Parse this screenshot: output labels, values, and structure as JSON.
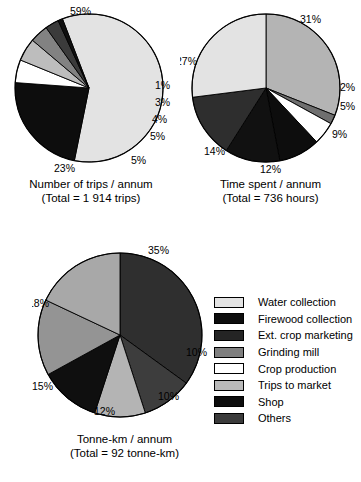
{
  "chart_data": [
    {
      "type": "pie",
      "id": "trips",
      "title": "Number of trips / annum",
      "subtitle": "(Total = 1  914 trips)",
      "total_label": "1  914 trips",
      "categories": [
        "Water collection",
        "Firewood collection",
        "Ext.  crop  marketing",
        "Grinding mill",
        "Crop production",
        "Trips to market",
        "Shop",
        "Others"
      ],
      "values": [
        59,
        23,
        1,
        3,
        4,
        5,
        5,
        0
      ],
      "labels": [
        "59%",
        "23%",
        "1%",
        "3%",
        "4%",
        "5%",
        "5%"
      ],
      "slices": [
        {
          "name": "Water collection",
          "value": 59,
          "label": "59%",
          "color": "#e3e3e3",
          "start": -111,
          "end": 101.4,
          "label_x": 70,
          "label_y": 2,
          "label_anchor": "center"
        },
        {
          "name": "Firewood collection",
          "value": 23,
          "label": "23%",
          "color": "#0d0d0d",
          "start": 101.4,
          "end": 184.2,
          "label_x": 54,
          "label_y": 159,
          "label_anchor": "center"
        },
        {
          "name": "Crop production",
          "value": 5,
          "label": "5%",
          "color": "#ffffff",
          "start": 184.2,
          "end": 202.2,
          "label_x": 131,
          "label_y": 151,
          "label_anchor": "center"
        },
        {
          "name": "Trips to market",
          "value": 5,
          "label": "5%",
          "color": "#bdbdbd",
          "start": 202.2,
          "end": 220.2,
          "label_x": 150,
          "label_y": 127,
          "label_anchor": "center"
        },
        {
          "name": "Grinding mill",
          "value": 4,
          "label": "4%",
          "color": "#828282",
          "start": 220.2,
          "end": 234.6,
          "label_x": 152,
          "label_y": 110,
          "label_anchor": "center"
        },
        {
          "name": "Others",
          "value": 3,
          "label": "3%",
          "color": "#3b3b3b",
          "start": 234.6,
          "end": 245.4,
          "label_x": 155,
          "label_y": 93,
          "label_anchor": "center"
        },
        {
          "name": "Shop",
          "value": 1,
          "label": "1%",
          "color": "#101010",
          "start": 245.4,
          "end": 249,
          "label_x": 155,
          "label_y": 76,
          "label_anchor": "center"
        }
      ]
    },
    {
      "type": "pie",
      "id": "time",
      "title": "Time spent / annum",
      "subtitle": "(Total = 736 hours)",
      "total_label": "736 hours",
      "values": [
        27,
        31,
        2,
        5,
        9,
        12,
        14
      ],
      "labels": [
        "31%",
        "27%",
        "2%",
        "5%",
        "9%",
        "12%",
        "14%"
      ],
      "slices": [
        {
          "name": "Trips to market",
          "value": 31,
          "label": "31%",
          "color": "#b4b4b4",
          "start": -90,
          "end": 21.6,
          "label_x": 120,
          "label_y": 10,
          "label_anchor": "center"
        },
        {
          "name": "Others",
          "value": 2,
          "label": "2%",
          "color": "#6f6f6f",
          "start": 21.6,
          "end": 28.8,
          "label_x": 160,
          "label_y": 78,
          "label_anchor": "center"
        },
        {
          "name": "Crop production",
          "value": 5,
          "label": "5%",
          "color": "#ffffff",
          "start": 28.8,
          "end": 46.8,
          "label_x": 160,
          "label_y": 97,
          "label_anchor": "center"
        },
        {
          "name": "Firewood collection",
          "value": 9,
          "label": "9%",
          "color": "#0d0d0d",
          "start": 46.8,
          "end": 79.2,
          "label_x": 152,
          "label_y": 125,
          "label_anchor": "center"
        },
        {
          "name": "Shop",
          "value": 12,
          "label": "12%",
          "color": "#111111",
          "start": 79.2,
          "end": 122.4,
          "label_x": 80,
          "label_y": 160,
          "label_anchor": "center"
        },
        {
          "name": "Ext. crop marketing",
          "value": 14,
          "label": "14%",
          "color": "#2e2e2e",
          "start": 122.4,
          "end": 172.8,
          "label_x": 24,
          "label_y": 142,
          "label_anchor": "center"
        },
        {
          "name": "Water collection",
          "value": 27,
          "label": "27%",
          "color": "#e3e3e3",
          "start": 172.8,
          "end": 270,
          "label_x": -4,
          "label_y": 52,
          "label_anchor": "center"
        }
      ]
    },
    {
      "type": "pie",
      "id": "tonnekm",
      "title": "Tonne-km / annum",
      "subtitle": "(Total = 92 tonne-km)",
      "total_label": "92 tonne-km",
      "values": [
        35,
        10,
        10,
        12,
        15,
        18
      ],
      "labels": [
        "35%",
        "10%",
        "10%",
        "12%",
        "15%",
        "18%"
      ],
      "slices": [
        {
          "name": "Ext. crop marketing",
          "value": 35,
          "label": "35%",
          "color": "#2f2f2f",
          "start": -90,
          "end": 36,
          "label_x": 116,
          "label_y": 2,
          "label_anchor": "center"
        },
        {
          "name": "Others",
          "value": 10,
          "label": "10%",
          "color": "#3d3d3d",
          "start": 36,
          "end": 72,
          "label_x": 154,
          "label_y": 104,
          "label_anchor": "center"
        },
        {
          "name": "Trips to market",
          "value": 10,
          "label": "10%",
          "color": "#b4b4b4",
          "start": 72,
          "end": 108,
          "label_x": 126,
          "label_y": 148,
          "label_anchor": "center"
        },
        {
          "name": "Shop",
          "value": 12,
          "label": "12%",
          "color": "#0f0f0f",
          "start": 108,
          "end": 151.2,
          "label_x": 62,
          "label_y": 163,
          "label_anchor": "center"
        },
        {
          "name": "Grinding mill",
          "value": 15,
          "label": "15%",
          "color": "#949494",
          "start": 151.2,
          "end": 205.2,
          "label_x": 0,
          "label_y": 138,
          "label_anchor": "center"
        },
        {
          "name": "Water collection",
          "value": 18,
          "label": "18%",
          "color": "#a8a8a8",
          "start": 205.2,
          "end": 270,
          "label_x": -4,
          "label_y": 55,
          "label_anchor": "center"
        }
      ]
    }
  ],
  "legend": {
    "position": "right-middle",
    "items": [
      {
        "label": "Water collection",
        "color": "#e3e3e3"
      },
      {
        "label": "Firewood collection",
        "color": "#0d0d0d"
      },
      {
        "label": "Ext.  crop  marketing",
        "color": "#242424"
      },
      {
        "label": "Grinding mill",
        "color": "#7f7f7f"
      },
      {
        "label": "Crop production",
        "color": "#ffffff"
      },
      {
        "label": "Trips to market",
        "color": "#b9b9b9"
      },
      {
        "label": "Shop",
        "color": "#0d0d0d"
      },
      {
        "label": "Others",
        "color": "#3b3b3b"
      }
    ]
  }
}
